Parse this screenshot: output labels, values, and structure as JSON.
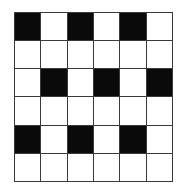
{
  "figure": {
    "kind": "grid-pattern",
    "rows": 6,
    "columns": 6,
    "colors": {
      "background": "#ffffff",
      "filled_cell": "#0a0a0a",
      "empty_cell": "#ffffff",
      "grid_line": "#3a3a3a"
    },
    "legend": {
      "filled_value": 1,
      "empty_value": 0
    },
    "cells": [
      [
        1,
        0,
        1,
        0,
        1,
        0
      ],
      [
        0,
        0,
        0,
        0,
        0,
        0
      ],
      [
        0,
        1,
        0,
        1,
        0,
        1
      ],
      [
        0,
        0,
        0,
        0,
        0,
        0
      ],
      [
        1,
        0,
        1,
        0,
        1,
        0
      ],
      [
        0,
        0,
        0,
        0,
        0,
        0
      ]
    ]
  }
}
